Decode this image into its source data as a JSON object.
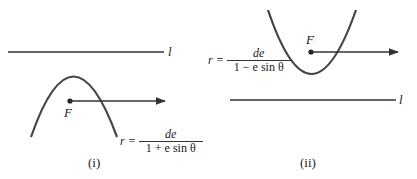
{
  "panels": [
    {
      "id": "i",
      "caption": "(i)",
      "directrix_label": "l",
      "focus_label": "F",
      "equation": {
        "lhs": "r =",
        "numerator": "de",
        "denominator": "1 + e sin θ"
      },
      "opening": "down",
      "directrix_position": "above focus"
    },
    {
      "id": "ii",
      "caption": "(ii)",
      "directrix_label": "l",
      "focus_label": "F",
      "equation": {
        "lhs": "r =",
        "numerator": "de",
        "denominator": "1 − e sin θ"
      },
      "opening": "up",
      "directrix_position": "below focus"
    }
  ],
  "colors": {
    "stroke": "#333333",
    "background": "#ffffff"
  }
}
